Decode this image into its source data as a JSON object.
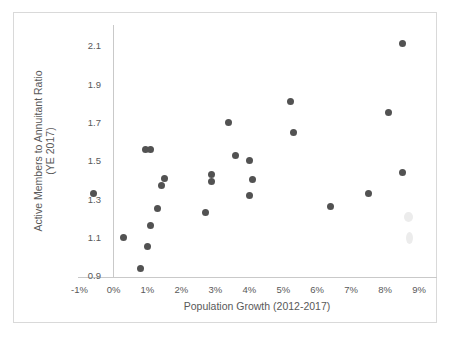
{
  "chart": {
    "border_color": "#d9d9d9",
    "axis_line_color": "#c9c9c9",
    "point_color": "#525252",
    "text_color": "#595959"
  },
  "chart_data": {
    "type": "scatter",
    "title": "",
    "xlabel": "Population Growth (2012-2017)",
    "ylabel": "Active Members to Annuitant Ratio (YE 2017)",
    "ylabel_line1": "Active Members to Annuitant Ratio",
    "ylabel_line2": "(YE 2017)",
    "xlim_percent": [
      -1,
      9.5
    ],
    "ylim": [
      0.9,
      2.2
    ],
    "grid": false,
    "legend": "none",
    "xticks": [
      {
        "value": -1,
        "label": "-1%"
      },
      {
        "value": 0,
        "label": "0%"
      },
      {
        "value": 1,
        "label": "1%"
      },
      {
        "value": 2,
        "label": "2%"
      },
      {
        "value": 3,
        "label": "3%"
      },
      {
        "value": 4,
        "label": "4%"
      },
      {
        "value": 5,
        "label": "5%"
      },
      {
        "value": 6,
        "label": "6%"
      },
      {
        "value": 7,
        "label": "7%"
      },
      {
        "value": 8,
        "label": "8%"
      },
      {
        "value": 9,
        "label": "9%"
      }
    ],
    "yticks": [
      {
        "value": 0.9,
        "label": "0.9"
      },
      {
        "value": 1.1,
        "label": "1.1"
      },
      {
        "value": 1.3,
        "label": "1.3"
      },
      {
        "value": 1.5,
        "label": "1.5"
      },
      {
        "value": 1.7,
        "label": "1.7"
      },
      {
        "value": 1.9,
        "label": "1.9"
      },
      {
        "value": 2.1,
        "label": "2.1"
      }
    ],
    "points": [
      {
        "x": -0.6,
        "y": 1.33
      },
      {
        "x": 0.3,
        "y": 1.1
      },
      {
        "x": 0.8,
        "y": 0.94
      },
      {
        "x": 0.95,
        "y": 1.56
      },
      {
        "x": 1.0,
        "y": 1.05
      },
      {
        "x": 1.1,
        "y": 1.16
      },
      {
        "x": 1.1,
        "y": 1.56
      },
      {
        "x": 1.3,
        "y": 1.25
      },
      {
        "x": 1.4,
        "y": 1.37
      },
      {
        "x": 1.5,
        "y": 1.41
      },
      {
        "x": 2.7,
        "y": 1.23
      },
      {
        "x": 2.9,
        "y": 1.43
      },
      {
        "x": 2.9,
        "y": 1.39
      },
      {
        "x": 3.4,
        "y": 1.7
      },
      {
        "x": 3.6,
        "y": 1.53
      },
      {
        "x": 4.0,
        "y": 1.5
      },
      {
        "x": 4.0,
        "y": 1.32
      },
      {
        "x": 4.1,
        "y": 1.4
      },
      {
        "x": 5.2,
        "y": 1.81
      },
      {
        "x": 5.3,
        "y": 1.65
      },
      {
        "x": 6.4,
        "y": 1.26
      },
      {
        "x": 7.5,
        "y": 1.33
      },
      {
        "x": 8.1,
        "y": 1.75
      },
      {
        "x": 8.5,
        "y": 1.44
      },
      {
        "x": 8.5,
        "y": 2.11
      }
    ]
  }
}
